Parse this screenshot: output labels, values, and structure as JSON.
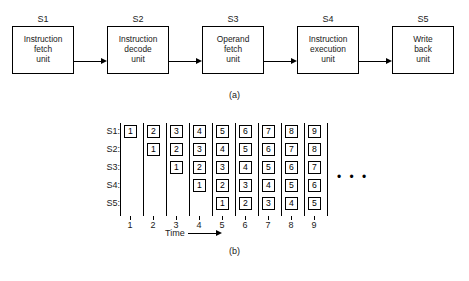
{
  "figure": {
    "parts": {
      "a": {
        "caption": "(a)",
        "stages": [
          {
            "label": "S1",
            "lines": [
              "Instruction",
              "fetch",
              "unit"
            ]
          },
          {
            "label": "S2",
            "lines": [
              "Instruction",
              "decode",
              "unit"
            ]
          },
          {
            "label": "S3",
            "lines": [
              "Operand",
              "fetch",
              "unit"
            ]
          },
          {
            "label": "S4",
            "lines": [
              "Instruction",
              "execution",
              "unit"
            ]
          },
          {
            "label": "S5",
            "lines": [
              "Write",
              "back",
              "unit"
            ]
          }
        ],
        "arrow_count": 4
      },
      "b": {
        "caption": "(b)",
        "axis_label": "Time",
        "row_labels": [
          "S1:",
          "S2:",
          "S3:",
          "S4:",
          "S5:"
        ],
        "tick_labels": [
          "1",
          "2",
          "3",
          "4",
          "5",
          "6",
          "7",
          "8",
          "9"
        ],
        "continuation": "• • •"
      }
    }
  },
  "chart_data": {
    "type": "table",
    "xlabel": "Time",
    "ylabel": "",
    "categories": [
      "1",
      "2",
      "3",
      "4",
      "5",
      "6",
      "7",
      "8",
      "9"
    ],
    "row_names": [
      "S1:",
      "S2:",
      "S3:",
      "S4:",
      "S5:"
    ],
    "grid": true,
    "legend": "none",
    "series": [
      {
        "name": "S1:",
        "values": [
          1,
          2,
          3,
          4,
          5,
          6,
          7,
          8,
          9
        ]
      },
      {
        "name": "S2:",
        "values": [
          null,
          1,
          2,
          3,
          4,
          5,
          6,
          7,
          8
        ]
      },
      {
        "name": "S3:",
        "values": [
          null,
          null,
          1,
          2,
          3,
          4,
          5,
          6,
          7
        ]
      },
      {
        "name": "S4:",
        "values": [
          null,
          null,
          null,
          1,
          2,
          3,
          4,
          5,
          6
        ]
      },
      {
        "name": "S5:",
        "values": [
          null,
          null,
          null,
          null,
          1,
          2,
          3,
          4,
          5
        ]
      }
    ],
    "annotations": [
      "• • •"
    ]
  },
  "layout": {
    "stage_geometry": [
      {
        "left": 12,
        "width": 62,
        "label_left": 12,
        "label_width": 62
      },
      {
        "left": 107,
        "width": 62,
        "label_left": 107,
        "label_width": 62
      },
      {
        "left": 202,
        "width": 62,
        "label_left": 202,
        "label_width": 62
      },
      {
        "left": 297,
        "width": 62,
        "label_left": 297,
        "label_width": 62
      },
      {
        "left": 392,
        "width": 62,
        "label_left": 392,
        "label_width": 62
      }
    ],
    "arrow_geometry": [
      {
        "left": 74,
        "width": 33
      },
      {
        "left": 169,
        "width": 33
      },
      {
        "left": 264,
        "width": 33
      },
      {
        "left": 359,
        "width": 33
      }
    ],
    "box_height": 48,
    "grid": {
      "label_left": 94,
      "row_top": [
        7,
        25,
        43,
        61,
        79
      ],
      "col_line_x": [
        120,
        143,
        166,
        189,
        212,
        235,
        258,
        281,
        304,
        327
      ],
      "col_cell_x": [
        124,
        147,
        170,
        193,
        216,
        239,
        262,
        285,
        308
      ],
      "line_top": 5,
      "line_height": 93,
      "tick_top": 98,
      "tick_label_top": 102
    }
  }
}
